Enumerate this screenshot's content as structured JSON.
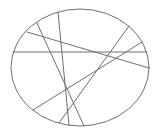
{
  "diagram": {
    "background": "#ffffff",
    "stroke_color": "#6e6e6e",
    "ellipse": {
      "cx": 80,
      "cy": 67.5,
      "rx": 69,
      "ry": 58.5
    },
    "chords": [
      {
        "id": "horizontal",
        "x1": 13,
        "y1": 52,
        "x2": 147,
        "y2": 52
      },
      {
        "id": "a",
        "x1": 27,
        "y1": 32,
        "x2": 149,
        "y2": 68
      },
      {
        "id": "b",
        "x1": 37,
        "y1": 23,
        "x2": 84,
        "y2": 126
      },
      {
        "id": "c",
        "x1": 58,
        "y1": 12,
        "x2": 69,
        "y2": 125
      },
      {
        "id": "d",
        "x1": 129,
        "y1": 26,
        "x2": 59,
        "y2": 123
      },
      {
        "id": "e",
        "x1": 142,
        "y1": 42,
        "x2": 33,
        "y2": 110
      }
    ]
  }
}
